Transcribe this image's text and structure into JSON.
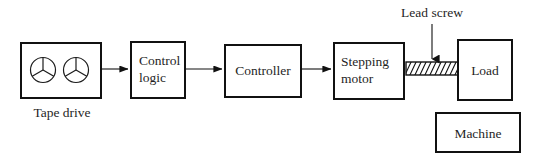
{
  "diagram": {
    "background_color": "#ffffff",
    "line_color": "#111111",
    "text_color": "#1f1f1f"
  },
  "blocks": {
    "tape_drive": {
      "caption": "Tape drive",
      "reel_count": 2,
      "spokes_per_reel": 3
    },
    "control_logic": {
      "line1": "Control",
      "line2": "logic"
    },
    "controller": {
      "label": "Controller"
    },
    "stepping_motor": {
      "line1": "Stepping",
      "line2": "motor"
    },
    "load": {
      "label": "Load"
    },
    "machine": {
      "label": "Machine"
    }
  },
  "annotations": {
    "lead_screw": {
      "label": "Lead screw",
      "pointer": "down-arrow",
      "hatch_direction": "lower-left-to-upper-right"
    }
  },
  "connectors": [
    {
      "from": "tape_drive",
      "to": "control_logic",
      "style": "arrow"
    },
    {
      "from": "control_logic",
      "to": "controller",
      "style": "arrow"
    },
    {
      "from": "controller",
      "to": "stepping_motor",
      "style": "arrow"
    },
    {
      "from": "stepping_motor",
      "to": "load",
      "style": "lead-screw"
    }
  ]
}
